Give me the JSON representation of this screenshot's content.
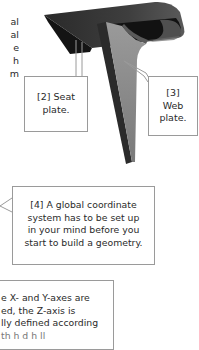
{
  "left_text_fragments": [
    "al",
    "al",
    "e",
    "h",
    "m"
  ],
  "callouts": {
    "seat_plate": {
      "lines": [
        "[2] Seat",
        "plate."
      ]
    },
    "web_plate": {
      "lines": [
        "[3]",
        "Web",
        "plate."
      ]
    },
    "coordinate_system": {
      "lines": [
        "[4] A global coordinate",
        "system has to be set up",
        "in your mind before you",
        "start to build a geometry."
      ]
    },
    "axes_note": {
      "lines": [
        "e X- and Y-axes are",
        "ed, the Z-axis is",
        "lly defined according",
        "th  h  d  h  ll  "
      ]
    }
  },
  "figure": {
    "colors": {
      "seat_top": "#3a3a3a",
      "seat_under": "#141414",
      "web_face": "#8a8a8a",
      "web_side": "#2b2b2b",
      "border": "#9a9a9a"
    }
  }
}
